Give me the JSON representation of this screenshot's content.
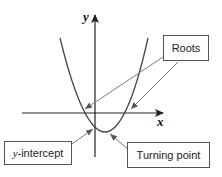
{
  "diagram": {
    "axes": {
      "x_label": "x",
      "y_label": "y"
    },
    "labels": {
      "roots": "Roots",
      "y_intercept_var": "y",
      "y_intercept_rest": "-intercept",
      "turning_point": "Turning point"
    },
    "colors": {
      "curve": "#444444",
      "axes": "#222222",
      "arrows": "#666666",
      "box_border": "#555555"
    }
  }
}
